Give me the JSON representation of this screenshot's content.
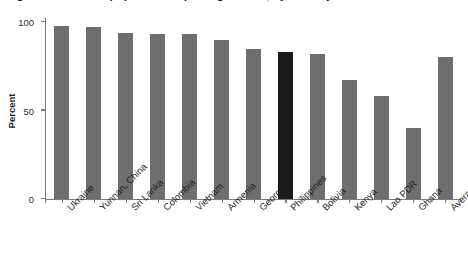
{
  "chart_data": {
    "type": "bar",
    "title": "Figure: Percent of population reporting access, by country",
    "xlabel": "",
    "ylabel": "Percent",
    "ylim": [
      0,
      100
    ],
    "yticks": [
      0,
      50,
      100
    ],
    "ytick_labels": [
      "0",
      "50",
      "100"
    ],
    "grid": false,
    "legend": null,
    "categories": [
      "Ukraine",
      "Yunnan, China",
      "Sri Lanka",
      "Colombia",
      "Vietnam",
      "Armenia",
      "Georgia",
      "Philippines",
      "Bolivia",
      "Kenya",
      "Lao PDR",
      "Ghana",
      "Average"
    ],
    "values": [
      98,
      97,
      94,
      93,
      93,
      90,
      85,
      83,
      82,
      67,
      58,
      40,
      80
    ],
    "highlight_category": "Philippines",
    "highlight_index": 7,
    "bar_color": "#6e6e6e",
    "highlight_color": "#1a1a1a",
    "axis_color": "#7b7b7b"
  }
}
